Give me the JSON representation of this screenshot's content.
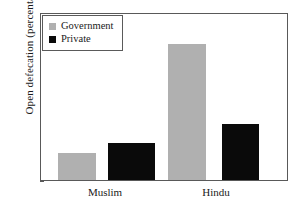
{
  "chart_data": {
    "type": "bar",
    "title": "",
    "xlabel": "",
    "ylabel": "Open defecation (percentage)",
    "categories": [
      "Muslim",
      "Hindu"
    ],
    "series": [
      {
        "name": "Government",
        "color": "#b0b0b0",
        "values": [
          8,
          41
        ]
      },
      {
        "name": "Private",
        "color": "#0a0a0a",
        "values": [
          11,
          17
        ]
      }
    ],
    "ylim": [
      0,
      50
    ],
    "yticks": [
      0,
      10,
      20,
      30,
      40,
      50
    ],
    "ytick_labels": [
      "0",
      "10",
      "20",
      "30",
      "40",
      "50"
    ],
    "grid": false,
    "legend_position": "top-left",
    "frame": true
  },
  "axes": {
    "y_title": "Open defecation (percentage)",
    "y_tick_labels": [
      "50",
      "40",
      "30",
      "20",
      "10",
      "0"
    ],
    "x_labels": [
      "Muslim",
      "Hindu"
    ]
  },
  "legend": {
    "items": [
      {
        "label": "Government",
        "swatch": "government-swatch"
      },
      {
        "label": "Private",
        "swatch": "private-swatch"
      }
    ]
  },
  "bars": [
    {
      "group": "Muslim",
      "series": "Government",
      "value": 8,
      "label": "8"
    },
    {
      "group": "Muslim",
      "series": "Private",
      "value": 11,
      "label": "11"
    },
    {
      "group": "Hindu",
      "series": "Government",
      "value": 41,
      "label": "41"
    },
    {
      "group": "Hindu",
      "series": "Private",
      "value": 17,
      "label": "17"
    }
  ],
  "colors": {
    "government": "#b0b0b0",
    "private": "#0a0a0a",
    "frame": "#595959",
    "text": "#1a1a1a",
    "background": "#ffffff"
  }
}
